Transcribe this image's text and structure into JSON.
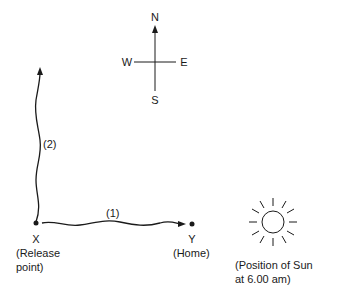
{
  "compass": {
    "north": "N",
    "south": "S",
    "east": "E",
    "west": "W"
  },
  "paths": [
    {
      "id": "1",
      "label": "(1)",
      "direction": "east",
      "from": "X",
      "to": "Y"
    },
    {
      "id": "2",
      "label": "(2)",
      "direction": "north",
      "from": "X"
    }
  ],
  "points": {
    "x": {
      "letter": "X",
      "caption_line1": "(Release",
      "caption_line2": "point)"
    },
    "y": {
      "letter": "Y",
      "caption": "(Home)"
    }
  },
  "sun": {
    "caption_line1": "(Position of Sun",
    "caption_line2": "at 6.00 am)"
  },
  "colors": {
    "line": "#1a1a1a",
    "background": "#ffffff"
  }
}
